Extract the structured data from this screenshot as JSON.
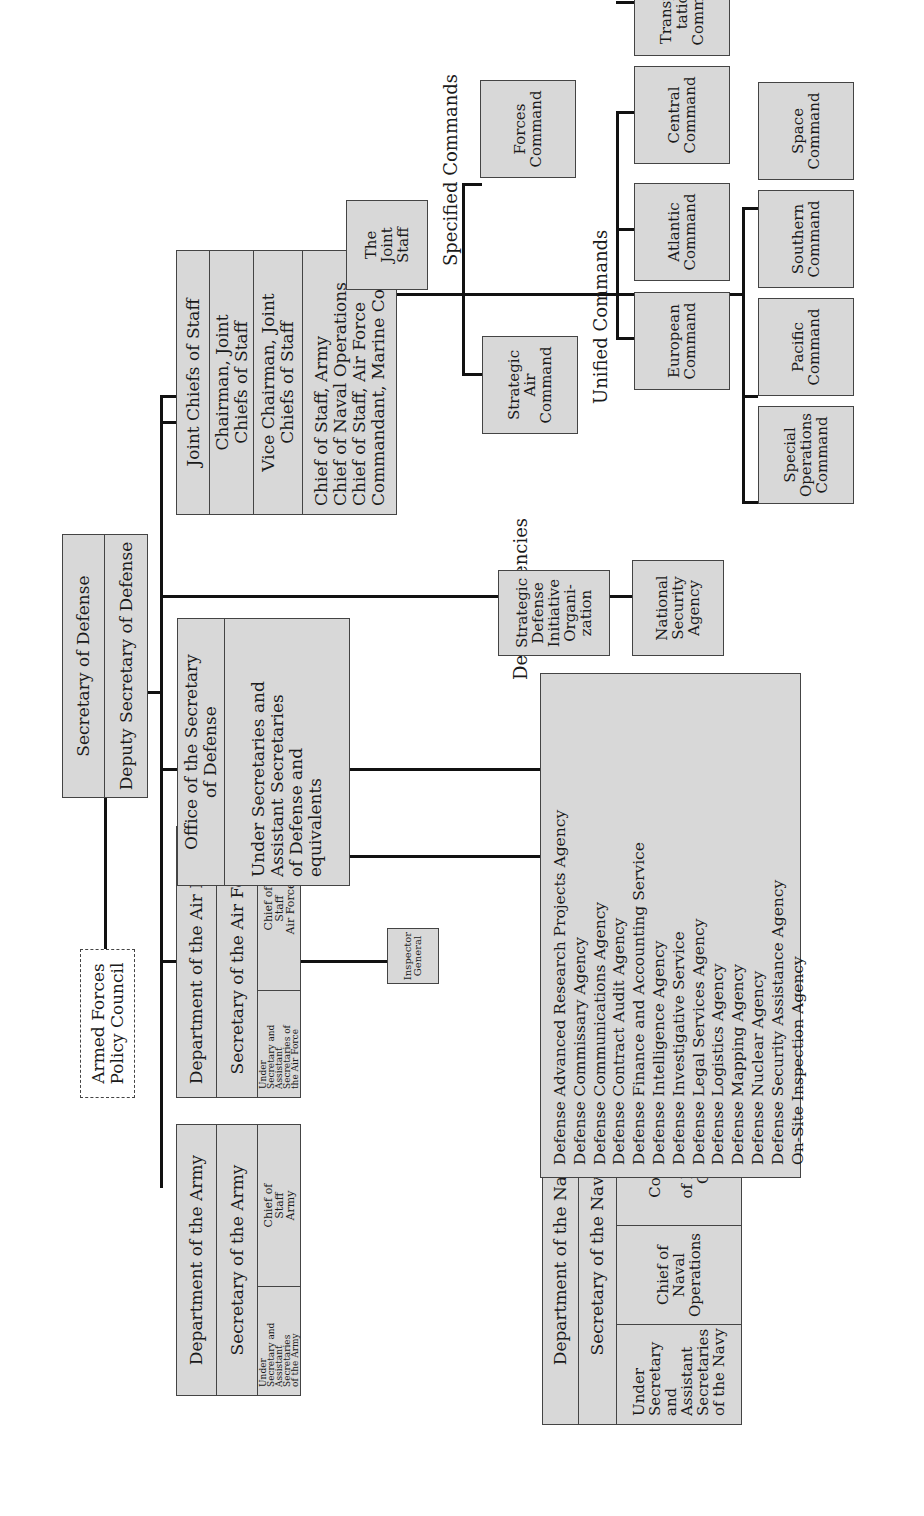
{
  "colors": {
    "box_fill": "#d8d8d8",
    "box_border": "#444444",
    "line": "#111111",
    "background": "#ffffff"
  },
  "top": {
    "secretary": "Secretary of Defense",
    "deputy": "Deputy Secretary of Defense",
    "policy_council": "Armed Forces\nPolicy Council"
  },
  "army": {
    "department": "Department of the Army",
    "secretary": "Secretary of the Army",
    "under": "Under\nSecretary and\nAssistant\nSecretaries\nof the Army",
    "chief": "Chief of\nStaff\nArmy",
    "major": "Army Major\nCommands\nand Agencies"
  },
  "air_force": {
    "department": "Department of the Air Force",
    "secretary": "Secretary of the Air Force",
    "under": "Under\nSecretary and\nAssistant\nSecretaries of\nthe Air Force",
    "chief": "Chief of\nStaff\nAir Force",
    "major": "Air Force Major\nCommands\nand Agencies"
  },
  "navy": {
    "department": "Department of the Navy",
    "secretary": "Secretary of the Navy",
    "under": "Under\nSecretary\nand\nAssistant\nSecretaries\nof the Navy",
    "cno": "Chief of\nNaval\nOperations",
    "commandant": "Comman-\ndant\nof Marine\nCorps",
    "navy_major": "Navy Major\nCommands\nand Agencies",
    "marine_major": "Marine Corps\nMajor\nCommands\nand Agencies"
  },
  "inspector_general": "Inspector\nGeneral",
  "osd": {
    "title": "Office of the Secretary\nof Defense",
    "under": "Under Secretaries and\nAssistant Secretaries\nof Defense and\nequivalents"
  },
  "defense_agencies": {
    "label": "Defense Agencies",
    "items": [
      "Defense Advanced Research Projects Agency",
      "Defense Commissary Agency",
      "Defense Communications Agency",
      "Defense Contract Audit Agency",
      "Defense Finance and Accounting Service",
      "Defense Intelligence Agency",
      "Defense Investigative Service",
      "Defense Legal Services Agency",
      "Defense Logistics Agency",
      "Defense Mapping Agency",
      "Defense Nuclear Agency",
      "Defense Security Assistance Agency",
      "On-Site Inspection Agency"
    ]
  },
  "sdio": "Strategic\nDefense\nInitiative\nOrgani-\nzation",
  "nsa": "National\nSecurity\nAgency",
  "jcs": {
    "title": "Joint Chiefs of Staff",
    "chairman": "Chairman, Joint\nChiefs of Staff",
    "vice": "Vice Chairman, Joint\nChiefs of Staff",
    "members": "Chief of Staff, Army\nChief of Naval Operations\nChief of Staff, Air Force\nCommandant, Marine Corps"
  },
  "joint_staff": "The\nJoint\nStaff",
  "specified_commands": {
    "label": "Specified Commands",
    "items": [
      "Strategic\nAir\nCommand",
      "Forces\nCommand"
    ]
  },
  "unified_commands": {
    "label": "Unified Commands",
    "row1": [
      "European\nCommand",
      "Atlantic\nCommand",
      "Central\nCommand",
      "Transpor-\ntation\nCommand"
    ],
    "row2": [
      "Special\nOperations\nCommand",
      "Pacific\nCommand",
      "Southern\nCommand",
      "Space\nCommand"
    ]
  }
}
